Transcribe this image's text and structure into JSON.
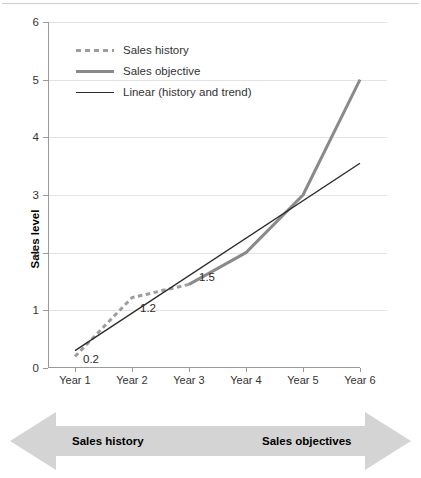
{
  "chart_data": {
    "type": "line",
    "title": "",
    "xlabel": "",
    "ylabel": "Sales level",
    "categories": [
      "Year 1",
      "Year 2",
      "Year 3",
      "Year 4",
      "Year 5",
      "Year 6"
    ],
    "ylim": [
      0,
      6
    ],
    "yticks": [
      0,
      1,
      2,
      3,
      4,
      5,
      6
    ],
    "ytick_labels": [
      "0",
      "1",
      "2",
      "3",
      "4",
      "5",
      "6"
    ],
    "grid": true,
    "legend_position": "top-left",
    "series": [
      {
        "name": "Sales history",
        "style": "dotted",
        "color": "#9d9d9d",
        "x": [
          "Year 1",
          "Year 2",
          "Year 3"
        ],
        "values": [
          0.2,
          1.22,
          1.45
        ]
      },
      {
        "name": "Sales objective",
        "style": "solid-thick",
        "color": "#8a8a8a",
        "x": [
          "Year 3",
          "Year 4",
          "Year 5",
          "Year 6"
        ],
        "values": [
          1.45,
          2.0,
          3.0,
          5.0
        ]
      },
      {
        "name": "Linear (history and trend)",
        "style": "solid-thin",
        "color": "#2b2b2b",
        "x": [
          "Year 1",
          "Year 6"
        ],
        "values": [
          0.3,
          3.55
        ]
      }
    ],
    "annotations": [
      {
        "text": "0.2",
        "x": "Year 1",
        "y": 0.2
      },
      {
        "text": "1.2",
        "x": "Year 2",
        "y": 1.2
      },
      {
        "text": "1.5",
        "x": "Year 3",
        "y": 1.5
      }
    ]
  },
  "legend": {
    "items": [
      {
        "label": "Sales history"
      },
      {
        "label": "Sales objective"
      },
      {
        "label": "Linear (history and trend)"
      }
    ]
  },
  "banner": {
    "left_label": "Sales history",
    "right_label": "Sales objectives",
    "fill": "#d4d4d4"
  }
}
